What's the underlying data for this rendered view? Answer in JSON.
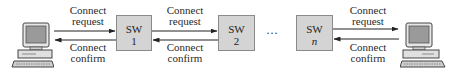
{
  "diagram": {
    "type": "connection-setup-sequence",
    "endpoints": {
      "left": {
        "icon": "computer-icon"
      },
      "right": {
        "icon": "computer-icon"
      }
    },
    "switches": [
      {
        "label": "SW",
        "index": "1"
      },
      {
        "label": "SW",
        "index": "2"
      },
      {
        "label": "SW",
        "index": "n",
        "index_italic": true
      }
    ],
    "ellipsis": "···",
    "links": [
      {
        "request": [
          "Connect",
          "request"
        ],
        "confirm": [
          "Connect",
          "confirm"
        ]
      },
      {
        "request": [
          "Connect",
          "request"
        ],
        "confirm": [
          "Connect",
          "confirm"
        ]
      },
      {
        "request": [
          "Connect",
          "request"
        ],
        "confirm": [
          "Connect",
          "confirm"
        ]
      }
    ],
    "colors": {
      "switch_fill": "#d4d4d4",
      "switch_border": "#8a8a8a",
      "arrow": "#222222",
      "text": "#2a2a2a"
    }
  }
}
